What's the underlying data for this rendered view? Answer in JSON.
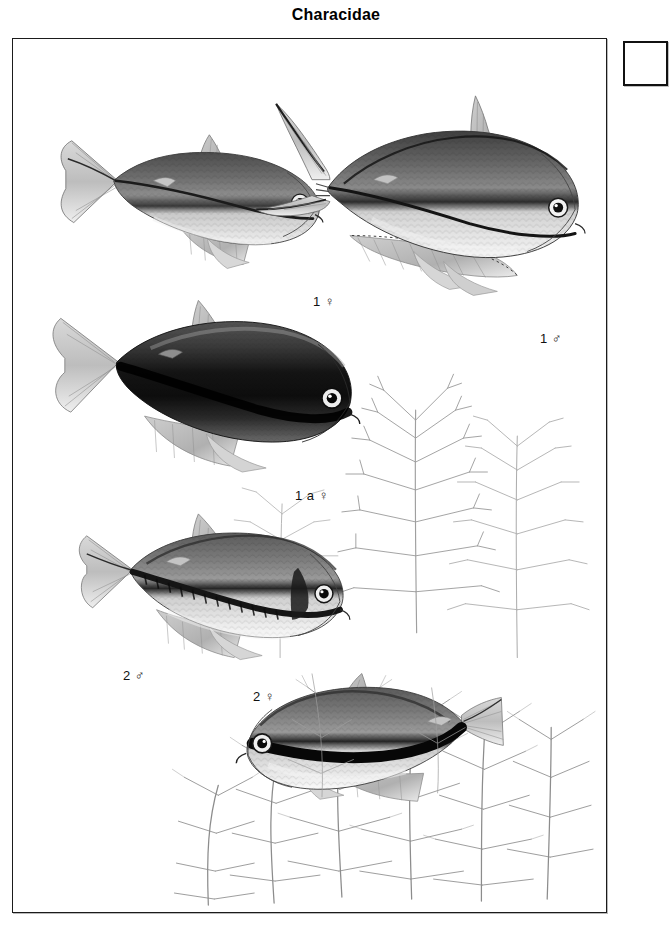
{
  "plate": {
    "title": "Characidae",
    "family": "Characidae",
    "background_color": "#ffffff",
    "ink_color": "#1b1b1b"
  },
  "corner_box": {
    "label": "",
    "border_color": "#111111",
    "fill_color": "#ffffff"
  },
  "figures": [
    {
      "id": "fig-1-female",
      "label": "1 ♀",
      "number": "1",
      "sex": "female",
      "sex_symbol": "♀",
      "orientation": "right",
      "description": "Silvery tetra with dark lateral stripe, moderate fins"
    },
    {
      "id": "fig-1-male",
      "label": "1 ♂",
      "number": "1",
      "sex": "male",
      "sex_symbol": "♂",
      "orientation": "right",
      "description": "Large tetra with elongated filamentous caudal and dorsal fins"
    },
    {
      "id": "fig-1a-female",
      "label": "1 a ♀",
      "number": "1 a",
      "sex": "female",
      "sex_symbol": "♀",
      "orientation": "right",
      "description": "Dark melanistic colour form, near black body"
    },
    {
      "id": "fig-2-male",
      "label": "2 ♂",
      "number": "2",
      "sex": "male",
      "sex_symbol": "♂",
      "orientation": "right",
      "description": "Tetra with bold dark mid-lateral band and scale rows"
    },
    {
      "id": "fig-2-female",
      "label": "2 ♀",
      "number": "2",
      "sex": "female",
      "sex_symbol": "♀",
      "orientation": "left",
      "description": "Tetra facing left with heavy black longitudinal stripe"
    }
  ],
  "vegetation": {
    "name": "feathery-whorled-aquatic-plant",
    "count": 6,
    "description": "Finely divided whorled aquatic plants filling the lower right and bottom of the plate"
  }
}
